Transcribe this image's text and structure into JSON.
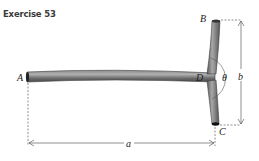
{
  "title": "Exercise 53",
  "labels": {
    "A": "A",
    "B": "B",
    "C": "C",
    "D": "D",
    "theta": "θ",
    "a": "a",
    "b": "b"
  },
  "colors": {
    "pipe": "#6b6b6b",
    "pipe_highlight": "#9a9a9a",
    "dimension": "#444444"
  }
}
